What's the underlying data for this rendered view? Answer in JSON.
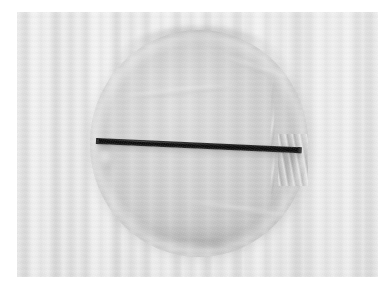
{
  "image": {
    "kind": "photograph",
    "subject_caption": "Circular translucent fabric disc with a dark straight rod laid horizontally across its centre, resting on light striped cloth",
    "width": 392,
    "height": 293,
    "orientation": "landscape",
    "colors": {
      "page_margin": "#ffffff",
      "cloth_background": "#e9e9e9",
      "cloth_stripe_light": "#f4f4f4",
      "cloth_stripe_dark": "#d6d6d6",
      "disc_fill": "#cdcdcd",
      "disc_edge_shadow": "#9a9a9a",
      "rod_dark": "#0c0c0c",
      "rod_highlight": "#3a3a3a"
    },
    "plate": {
      "left": 17,
      "top": 12,
      "width": 361,
      "height": 265
    },
    "regions": [
      {
        "name": "background-cloth",
        "label": "Light grey woven cloth with faint vertical stripes",
        "tone": "#e9e9e9"
      },
      {
        "name": "fabric-disc",
        "label": "Round translucent fabric disc",
        "tone": "#cdcdcd",
        "center_x": 182,
        "center_y": 131,
        "diameter_x": 218,
        "diameter_y": 227
      },
      {
        "name": "dark-rod",
        "label": "Dark slender rod across the disc diameter",
        "tone": "#0c0c0c",
        "start_x": 97,
        "start_y": 139,
        "end_x": 300,
        "end_y": 149,
        "thickness": 6,
        "angle_deg": 2.6
      }
    ],
    "details": [
      {
        "name": "pleats-right-edge",
        "label": "Gathered pleats along right rim of disc"
      },
      {
        "name": "gather-knot-right",
        "label": "Tight fabric gather where rod exits right side"
      },
      {
        "name": "fold-left-edge",
        "label": "Small fold lobe where rod enters left side"
      },
      {
        "name": "crease-lower-arc",
        "label": "Crease arc across lower half of disc"
      },
      {
        "name": "crease-bottom-knot",
        "label": "Dark gather smudge at bottom of disc"
      },
      {
        "name": "top-seam",
        "label": "Folded seam shadow along upper circumference"
      }
    ]
  }
}
